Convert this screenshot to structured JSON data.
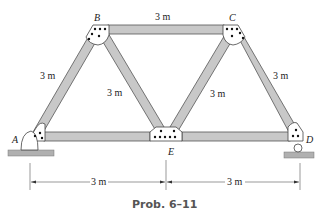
{
  "figure": {
    "caption": "Prob. 6–11",
    "type": "Pratt/Warren truss diagram",
    "colors": {
      "member_fill": "#c8c8c8",
      "member_stroke": "#555555",
      "gusset_fill": "#ffffff",
      "ground_fill": "#b0b0b0",
      "line": "#333333"
    }
  },
  "nodes": {
    "A": {
      "label": "A",
      "x": 32,
      "y": 138
    },
    "B": {
      "label": "B",
      "x": 98,
      "y": 30
    },
    "C": {
      "label": "C",
      "x": 233,
      "y": 30
    },
    "D": {
      "label": "D",
      "x": 298,
      "y": 138
    },
    "E": {
      "label": "E",
      "x": 166,
      "y": 138
    }
  },
  "members": [
    {
      "from": "A",
      "to": "B",
      "length_label": "3 m"
    },
    {
      "from": "B",
      "to": "C",
      "length_label": "3 m"
    },
    {
      "from": "C",
      "to": "D",
      "length_label": "3 m"
    },
    {
      "from": "B",
      "to": "E",
      "length_label": "3 m"
    },
    {
      "from": "C",
      "to": "E",
      "length_label": "3 m"
    },
    {
      "from": "A",
      "to": "E",
      "length_label": ""
    },
    {
      "from": "E",
      "to": "D",
      "length_label": ""
    }
  ],
  "labels": {
    "ab": "3 m",
    "bc": "3 m",
    "cd": "3 m",
    "be": "3 m",
    "ce": "3 m"
  },
  "dimensions": {
    "ae": "3 m",
    "ed": "3 m"
  },
  "supports": {
    "A": "pin",
    "D": "roller"
  }
}
